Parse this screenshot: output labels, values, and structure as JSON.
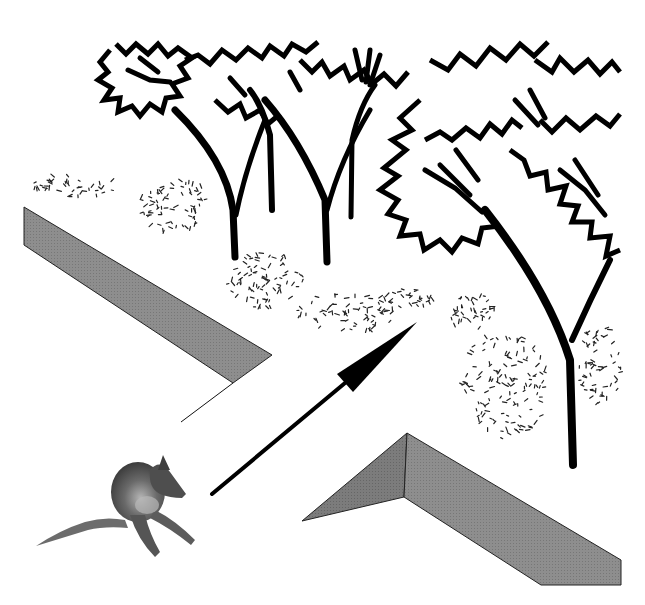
{
  "scene": {
    "description": "Diagram of a small animal facing a gap between two walls, with an arrow pointing toward a grove of trees",
    "background": "#ffffff"
  },
  "colors": {
    "ink": "#000000",
    "wall_face": "#8c8c8c",
    "wall_face_dark": "#7a7a7a",
    "wall_edge": "#222222",
    "animal_body": "#5a5a5a",
    "animal_highlight": "#a8a8a8"
  },
  "walls": {
    "left": {
      "face": [
        [
          24,
          207
        ],
        [
          272,
          355
        ],
        [
          233,
          383
        ],
        [
          24,
          245
        ]
      ],
      "tail_line": [
        [
          233,
          383
        ],
        [
          181,
          422
        ]
      ]
    },
    "right": {
      "side_face": [
        [
          302,
          521
        ],
        [
          407,
          433
        ],
        [
          404,
          497
        ]
      ],
      "main_face": [
        [
          407,
          433
        ],
        [
          621,
          560
        ],
        [
          621,
          585
        ],
        [
          541,
          585
        ],
        [
          404,
          497
        ]
      ]
    }
  },
  "arrow": {
    "tail": [
      212,
      494
    ],
    "tip": [
      417,
      322
    ],
    "head_base": [
      [
        337,
        374
      ],
      [
        353,
        392
      ]
    ],
    "shaft_width": 4
  },
  "trees": [
    {
      "id": "tree-1",
      "trunk": "M235,257 L233,210 Q226,160 175,110",
      "trunk2": "M236,215 Q245,170 265,120",
      "width": 7
    },
    {
      "id": "tree-2",
      "trunk": "M272,210 L270,135 Q262,105 250,90",
      "trunk2": "",
      "width": 6
    },
    {
      "id": "tree-3",
      "trunk": "M327,262 L325,200 Q300,140 265,100",
      "trunk2": "M327,210 Q340,160 370,110",
      "width": 7
    },
    {
      "id": "tree-4",
      "trunk": "M351,217 L352,140 Q360,105 375,85",
      "trunk2": "",
      "width": 5
    },
    {
      "id": "tree-5",
      "trunk": "M573,465 L570,360 Q548,290 485,210",
      "trunk2": "M572,340 Q590,300 610,260",
      "width": 8
    }
  ],
  "animal": {
    "label": "small marsupial (seated)",
    "position": [
      105,
      465
    ]
  }
}
